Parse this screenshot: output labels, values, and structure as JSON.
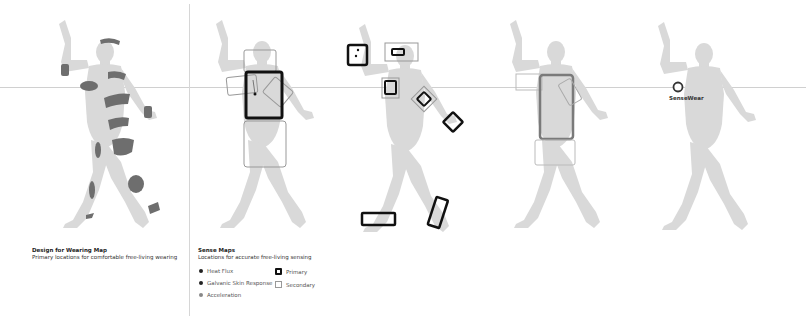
{
  "panels": {
    "wearing_map": {
      "title": "Design for Wearing Map",
      "subtitle": "Primary locations for comfortable free-living wearing"
    },
    "sense_maps": {
      "title": "Sense Maps",
      "subtitle": "Locations for accurate free-living sensing"
    },
    "sensewear": {
      "label": "SenseWear"
    }
  },
  "legend": {
    "sensors": [
      {
        "label": "Heat Flux",
        "icon": "dark-dot"
      },
      {
        "label": "Galvanic Skin Response",
        "icon": "dark-dot"
      },
      {
        "label": "Acceleration",
        "icon": "light-dot"
      }
    ],
    "locations": [
      {
        "label": "Primary",
        "icon": "thick-square"
      },
      {
        "label": "Secondary",
        "icon": "thin-square"
      }
    ]
  },
  "colors": {
    "body": "#d9d9d9",
    "wear_zone": "#6e6e6e",
    "primary_box": "#111111",
    "secondary_box": "#999999",
    "guide_line": "#d0d0d0"
  }
}
